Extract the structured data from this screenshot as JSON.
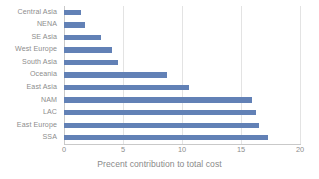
{
  "chart_data": {
    "type": "bar",
    "orientation": "horizontal",
    "title": "",
    "subtitle": "",
    "xlabel": "Precent contribution to total cost",
    "ylabel": "",
    "categories": [
      "Central Asia",
      "NENA",
      "SE Asia",
      "West Europe",
      "South Asia",
      "Oceania",
      "East Asia",
      "NAM",
      "LAC",
      "East Europe",
      "SSA"
    ],
    "values": [
      1.4,
      1.8,
      3.1,
      4.1,
      4.6,
      8.7,
      10.6,
      15.9,
      16.3,
      16.5,
      17.3
    ],
    "xlim": [
      0,
      20
    ],
    "xticks": [
      0,
      5,
      10,
      15,
      20
    ],
    "xtick_labels": [
      "0",
      "5",
      "10",
      "15",
      "20"
    ],
    "grid": "vertical",
    "legend": "none",
    "series": [
      {
        "name": "Precent contribution to total cost",
        "color": "#6281b6",
        "values": [
          1.4,
          1.8,
          3.1,
          4.1,
          4.6,
          8.7,
          10.6,
          15.9,
          16.3,
          16.5,
          17.3
        ]
      }
    ]
  },
  "colors": {
    "bar": "#6281b6",
    "grid": "#e3e3e3",
    "axis": "#c9c9c9",
    "text": "#8d8d8d",
    "background": "#ffffff"
  }
}
